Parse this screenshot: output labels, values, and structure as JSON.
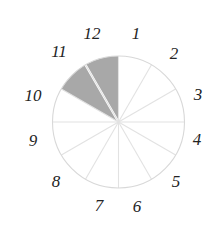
{
  "figure": {
    "kind": "clock-face-pie-chart",
    "title": "",
    "background_color": "#ffffff",
    "circle": {
      "center_x": 118.5,
      "center_y": 122,
      "radius": 66,
      "outline_color": "#d8d8d8",
      "outline_width": 1.1
    },
    "spokes": {
      "color": "#e2e2e2",
      "width": 1.1,
      "count": 12,
      "style": "solid-light"
    },
    "shaded": {
      "fill_color": "#a8a8a8",
      "divider_color": "#ffffff",
      "divider_width": 2.2,
      "start_hour": 10,
      "end_hour": 12,
      "sectors": [
        {
          "from_hour": 10,
          "to_hour": 11
        },
        {
          "from_hour": 11,
          "to_hour": 12
        }
      ]
    },
    "numbers": [
      {
        "label": "12",
        "hour": 12,
        "x": 92,
        "y": 33
      },
      {
        "label": "1",
        "hour": 1,
        "x": 136,
        "y": 33
      },
      {
        "label": "2",
        "hour": 2,
        "x": 174,
        "y": 53
      },
      {
        "label": "3",
        "hour": 3,
        "x": 198,
        "y": 94
      },
      {
        "label": "4",
        "hour": 4,
        "x": 197,
        "y": 139
      },
      {
        "label": "5",
        "hour": 5,
        "x": 176,
        "y": 181
      },
      {
        "label": "6",
        "hour": 6,
        "x": 137,
        "y": 206
      },
      {
        "label": "7",
        "hour": 7,
        "x": 99,
        "y": 205
      },
      {
        "label": "8",
        "hour": 8,
        "x": 56,
        "y": 181
      },
      {
        "label": "9",
        "hour": 9,
        "x": 33,
        "y": 140
      },
      {
        "label": "10",
        "hour": 10,
        "x": 33,
        "y": 95
      },
      {
        "label": "11",
        "hour": 11,
        "x": 59,
        "y": 51
      }
    ]
  },
  "chart_data": {
    "type": "pie",
    "title": "",
    "xlabel": "",
    "ylabel": "",
    "categories": [
      "12",
      "1",
      "2",
      "3",
      "4",
      "5",
      "6",
      "7",
      "8",
      "9",
      "10",
      "11"
    ],
    "values": [
      1,
      1,
      1,
      1,
      1,
      1,
      1,
      1,
      1,
      1,
      1,
      1
    ],
    "slice_labels": [
      "12",
      "1",
      "2",
      "3",
      "4",
      "5",
      "6",
      "7",
      "8",
      "9",
      "10",
      "11"
    ],
    "highlighted_slices": [
      "10",
      "11"
    ],
    "highlight_color": "#a8a8a8",
    "unhighlighted_color": "#ffffff",
    "outline_color": "#d8d8d8",
    "legend": "none",
    "grid": false
  }
}
